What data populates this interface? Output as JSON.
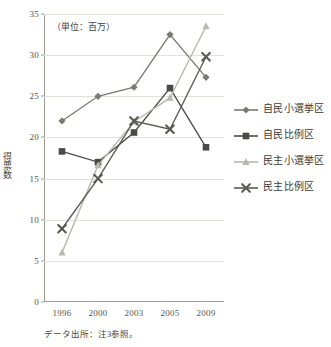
{
  "chart_data": {
    "type": "line",
    "title": "",
    "subtitle": "",
    "unit_note": "（単位：百万）",
    "xlabel": "",
    "ylabel": "得票数",
    "categories": [
      "1996",
      "2000",
      "2003",
      "2005",
      "2009"
    ],
    "ylim": [
      0,
      35
    ],
    "ytick_values": [
      0,
      5,
      10,
      15,
      20,
      25,
      30,
      35
    ],
    "ytick_labels": [
      "0",
      "5",
      "10",
      "15",
      "20",
      "25",
      "30",
      "35"
    ],
    "grid": true,
    "legend_position": "right",
    "series": [
      {
        "name": "自民小選挙区",
        "marker": "diamond",
        "color": "#7a7a72",
        "values": [
          22.0,
          25.0,
          26.1,
          32.5,
          27.3
        ]
      },
      {
        "name": "自民比例区",
        "marker": "square",
        "color": "#4a4a46",
        "values": [
          18.3,
          17.0,
          20.6,
          26.0,
          18.8
        ]
      },
      {
        "name": "民主小選挙区",
        "marker": "triangle",
        "color": "#b8b8ae",
        "values": [
          6.0,
          16.6,
          21.9,
          24.8,
          33.5
        ]
      },
      {
        "name": "民主比例区",
        "marker": "x",
        "color": "#5a5a54",
        "values": [
          8.9,
          15.0,
          22.0,
          21.0,
          29.8
        ]
      }
    ],
    "footnote": "データ出所：注3参照。"
  }
}
